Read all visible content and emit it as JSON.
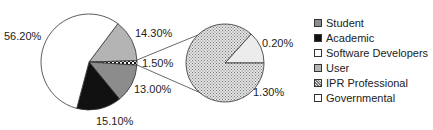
{
  "chart_data": {
    "type": "pie",
    "subtype": "pie-of-pie",
    "title": "",
    "main_pie": {
      "slices": [
        {
          "label": "User",
          "value": 14.3,
          "display": "14.30%",
          "color": "#b4b4b4",
          "pattern": "solid"
        },
        {
          "label": "IPR Professional (group)",
          "value": 1.5,
          "display": "1.50%",
          "color": "#ffffff",
          "pattern": "checker"
        },
        {
          "label": "Student",
          "value": 13.0,
          "display": "13.00%",
          "color": "#8c8c8c",
          "pattern": "solid"
        },
        {
          "label": "Academic",
          "value": 15.1,
          "display": "15.10%",
          "color": "#111111",
          "pattern": "solid"
        },
        {
          "label": "Software Developers",
          "value": 56.2,
          "display": "56.20%",
          "color": "#ffffff",
          "pattern": "solid"
        }
      ]
    },
    "secondary_pie": {
      "breakdown_of": "1.50%",
      "slices": [
        {
          "label": "Governmental",
          "value": 0.2,
          "display": "0.20%",
          "color": "#ececec",
          "pattern": "solid"
        },
        {
          "label": "IPR Professional",
          "value": 1.3,
          "display": "1.30%",
          "color": "#d8d8d8",
          "pattern": "dotted"
        }
      ]
    },
    "legend": {
      "position": "right",
      "entries": [
        {
          "label": "Student",
          "color": "#8c8c8c",
          "pattern": "solid"
        },
        {
          "label": "Academic",
          "color": "#111111",
          "pattern": "solid"
        },
        {
          "label": "Software Developers",
          "color": "#ffffff",
          "pattern": "solid"
        },
        {
          "label": "User",
          "color": "#b4b4b4",
          "pattern": "solid"
        },
        {
          "label": "IPR Professional",
          "color": "#d8d8d8",
          "pattern": "dotted"
        },
        {
          "label": "Governmental",
          "color": "#ffffff",
          "pattern": "solid"
        }
      ]
    }
  },
  "labels": {
    "software_developers": "56.20%",
    "user": "14.30%",
    "ipr_group": "1.50%",
    "student": "13.00%",
    "academic": "15.10%",
    "governmental": "0.20%",
    "ipr_professional": "1.30%"
  },
  "legend": {
    "items": [
      {
        "label": "Student"
      },
      {
        "label": "Academic"
      },
      {
        "label": "Software Developers"
      },
      {
        "label": "User"
      },
      {
        "label": "IPR Professional"
      },
      {
        "label": "Governmental"
      }
    ]
  }
}
